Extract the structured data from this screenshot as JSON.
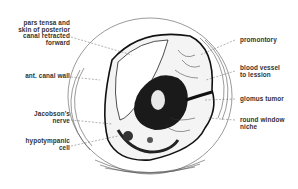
{
  "diagram": {
    "type": "anatomical illustration",
    "labels_left": [
      {
        "id": "pars-tensa",
        "text": "pars tensa and skin of posterior canal retracted forward",
        "lines": [
          "pars tensa and",
          "skin of posterior",
          "canal retracted",
          "forward"
        ]
      },
      {
        "id": "ant-canal-wall",
        "text": "ant. canal wall",
        "lines": [
          "ant. canal wall"
        ]
      },
      {
        "id": "jacobsons-nerve",
        "text": "Jacobson's nerve",
        "lines": [
          "Jacobson's",
          "nerve"
        ]
      },
      {
        "id": "hypotympanic-cell",
        "text": "hypotympanic cell",
        "lines": [
          "hypotympanic",
          "cell"
        ]
      }
    ],
    "labels_right": [
      {
        "id": "promontory",
        "text": "promontory",
        "lines": [
          "promontory"
        ]
      },
      {
        "id": "blood-vessel",
        "text": "blood vessel to lession",
        "lines": [
          "blood vessel",
          "to lession"
        ]
      },
      {
        "id": "glomus-tumor",
        "text": "glomus tumor",
        "lines": [
          "glomus tumor"
        ]
      },
      {
        "id": "round-window",
        "text": "round window niche",
        "lines": [
          "round window",
          "niche"
        ]
      }
    ],
    "colors": {
      "ink": "#1a1a1a",
      "line": "#555555",
      "background": "#ffffff"
    }
  }
}
